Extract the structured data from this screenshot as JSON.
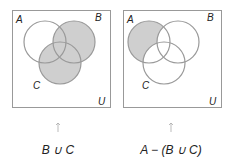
{
  "diagrams": [
    {
      "caption": "B ∪ C",
      "labels": {
        "a": "A",
        "b": "B",
        "c": "C",
        "u": "U"
      },
      "shaded": "B union C",
      "fill_color": "#cfcfcf",
      "stroke_color": "#999999"
    },
    {
      "caption": "A − (B ∪ C)",
      "labels": {
        "a": "A",
        "b": "B",
        "c": "C",
        "u": "U"
      },
      "shaded": "A minus (B union C)",
      "fill_color": "#cfcfcf",
      "stroke_color": "#999999"
    }
  ]
}
